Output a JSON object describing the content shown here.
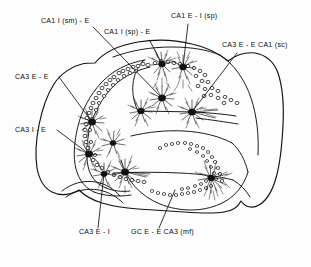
{
  "figure": {
    "type": "hippocampal-circuit-schematic",
    "background_color": "#fdfdfd",
    "ink_color": "#111111",
    "regions": [
      "CA1",
      "CA3",
      "Dentate Gyrus"
    ]
  },
  "labels": [
    {
      "id": "ca1-i-sm-e",
      "text": "CA1 I (sm) - E",
      "x": 41,
      "y": 23
    },
    {
      "id": "ca1-i-sp-e",
      "text": "CA1 I (sp) - E",
      "x": 104,
      "y": 34
    },
    {
      "id": "ca1-e-i-sp",
      "text": "CA1 E - I (sp)",
      "x": 171,
      "y": 18
    },
    {
      "id": "ca3-e-e-ca1-sc",
      "text": "CA3 E - E CA1 (sc)",
      "x": 222,
      "y": 47
    },
    {
      "id": "ca3-e-e",
      "text": "CA3 E - E",
      "x": 15,
      "y": 79
    },
    {
      "id": "ca3-i-e",
      "text": "CA3 I - E",
      "x": 15,
      "y": 132
    },
    {
      "id": "ca3-e-i",
      "text": "CA3 E - I",
      "x": 79,
      "y": 234
    },
    {
      "id": "gc-e-e-ca3-mf",
      "text": "GC E - E CA3 (mf)",
      "x": 131,
      "y": 234
    }
  ],
  "leader_lines": [
    {
      "id": "leader-ca1-i-sm-e",
      "from": [
        93,
        27
      ],
      "to": [
        162,
        98
      ]
    },
    {
      "id": "leader-ca1-i-sp-e",
      "from": [
        150,
        41
      ],
      "to": [
        162,
        64
      ]
    },
    {
      "id": "leader-ca1-e-i-sp",
      "from": [
        188,
        24
      ],
      "to": [
        183,
        67
      ]
    },
    {
      "id": "leader-ca3-e-e-ca1-sc",
      "from": [
        237,
        53
      ],
      "to": [
        192,
        112
      ]
    },
    {
      "id": "leader-ca3-e-e",
      "from": [
        59,
        77
      ],
      "to": [
        92,
        122
      ]
    },
    {
      "id": "leader-ca3-i-e",
      "from": [
        57,
        130
      ],
      "to": [
        89,
        154
      ]
    },
    {
      "id": "leader-ca3-e-i",
      "from": [
        98,
        228
      ],
      "to": [
        104,
        174
      ]
    },
    {
      "id": "leader-gc-e-e-ca3-mf",
      "from": [
        159,
        228
      ],
      "to": [
        175,
        190
      ]
    }
  ],
  "neurons": [
    {
      "id": "ca1-pyramidal-left",
      "region": "CA1",
      "type": "excitatory",
      "x": 162,
      "y": 64
    },
    {
      "id": "ca1-pyramidal-right",
      "region": "CA1",
      "type": "excitatory",
      "x": 183,
      "y": 67
    },
    {
      "id": "ca1-interneuron-mid",
      "region": "CA1",
      "type": "inhibitory",
      "x": 162,
      "y": 98
    },
    {
      "id": "ca1-interneuron-left",
      "region": "CA1",
      "type": "inhibitory",
      "x": 141,
      "y": 111
    },
    {
      "id": "ca1-pyramidal-lower",
      "region": "CA1",
      "type": "excitatory",
      "x": 192,
      "y": 112
    },
    {
      "id": "ca3-pyramidal-upper",
      "region": "CA3",
      "type": "excitatory",
      "x": 92,
      "y": 122
    },
    {
      "id": "ca3-small-cell",
      "region": "CA3",
      "type": "excitatory",
      "x": 113,
      "y": 143
    },
    {
      "id": "ca3-interneuron",
      "region": "CA3",
      "type": "inhibitory",
      "x": 89,
      "y": 154
    },
    {
      "id": "ca3-basket-cell",
      "region": "CA3",
      "type": "inhibitory",
      "x": 104,
      "y": 174
    },
    {
      "id": "ca3-pyramidal-lower",
      "region": "CA3",
      "type": "excitatory",
      "x": 125,
      "y": 172
    },
    {
      "id": "dg-granule-cell",
      "region": "Dentate Gyrus",
      "type": "excitatory",
      "x": 211,
      "y": 178
    }
  ],
  "cell_layers": [
    {
      "id": "ca3-pyramidal-layer",
      "region": "CA3",
      "style": "open-circles"
    },
    {
      "id": "ca1-pyramidal-layer",
      "region": "CA1",
      "style": "open-circles"
    },
    {
      "id": "dg-granule-layer-upper",
      "region": "Dentate Gyrus",
      "style": "open-circles"
    },
    {
      "id": "dg-granule-layer-lower",
      "region": "Dentate Gyrus",
      "style": "open-circles"
    }
  ]
}
